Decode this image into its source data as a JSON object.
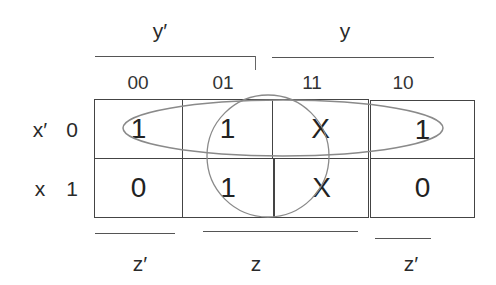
{
  "kmap": {
    "top_groups": [
      {
        "label": "y′"
      },
      {
        "label": "y"
      }
    ],
    "column_codes": [
      "00",
      "01",
      "11",
      "10"
    ],
    "rows": [
      {
        "var_label": "x′",
        "code": "0",
        "cells": [
          "1",
          "1",
          "X",
          "1"
        ]
      },
      {
        "var_label": "x",
        "code": "1",
        "cells": [
          "0",
          "1",
          "X",
          "0"
        ]
      }
    ],
    "bottom_groups": [
      {
        "label": "z′"
      },
      {
        "label": "z"
      },
      {
        "label": "z′"
      }
    ],
    "groupings": [
      {
        "shape": "ellipse",
        "covers": "row x'=0, all columns"
      },
      {
        "shape": "circle",
        "covers": "columns 01 and 11, both rows"
      }
    ],
    "colors": {
      "grid": "#444444",
      "group_outline": "#8a8a8a",
      "text": "#222222"
    }
  }
}
